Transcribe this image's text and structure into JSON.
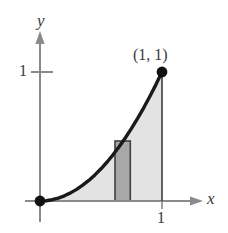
{
  "figure": {
    "background_color": "#ffffff",
    "axis_color": "#8a8a8a",
    "curve_color": "#1a1a1a",
    "region_fill_color": "#e3e3e3",
    "element_fill_color": "#a8a8a8",
    "element_stroke_color": "#3f3f3f",
    "text_color": "#3a3a3a"
  },
  "labels": {
    "y_axis": "y",
    "x_axis": "x",
    "y_tick_1": "1",
    "x_tick_1": "1",
    "point_1_1": "(1, 1)"
  },
  "chart_data": {
    "type": "line",
    "title": "",
    "xlabel": "x",
    "ylabel": "y",
    "xlim": [
      0,
      1
    ],
    "ylim": [
      0,
      1
    ],
    "grid": false,
    "legend": "none",
    "xticks": [
      1
    ],
    "xticklabels": [
      "1"
    ],
    "yticks": [
      1
    ],
    "yticklabels": [
      "1"
    ],
    "series": [
      {
        "name": "y = x^2",
        "x": [
          0,
          0.05,
          0.1,
          0.15,
          0.2,
          0.25,
          0.3,
          0.35,
          0.4,
          0.45,
          0.5,
          0.55,
          0.6,
          0.65,
          0.7,
          0.75,
          0.8,
          0.85,
          0.9,
          0.95,
          1
        ],
        "y": [
          0,
          0.0025,
          0.01,
          0.0225,
          0.04,
          0.0625,
          0.09,
          0.1225,
          0.16,
          0.2025,
          0.25,
          0.3025,
          0.36,
          0.4225,
          0.49,
          0.5625,
          0.64,
          0.7225,
          0.81,
          0.9025,
          1
        ]
      }
    ],
    "shaded_region": {
      "name": "area under curve",
      "x_range": [
        0,
        1
      ],
      "upper": "y = x^2",
      "lower": "y = 0",
      "fill": "#e3e3e3"
    },
    "representative_rectangle": {
      "name": "representative element",
      "x_left": 0.615,
      "x_right": 0.74,
      "y_bottom": 0,
      "y_top": 0.465,
      "fill": "#a8a8a8"
    },
    "points": [
      {
        "label": "(1, 1)",
        "x": 1,
        "y": 1,
        "marker": "filled-circle"
      },
      {
        "label": "",
        "x": 0,
        "y": 0,
        "marker": "filled-circle"
      }
    ],
    "annotations": [
      {
        "text": "(1, 1)",
        "x": 1,
        "y": 1,
        "position": "above-left"
      }
    ]
  }
}
